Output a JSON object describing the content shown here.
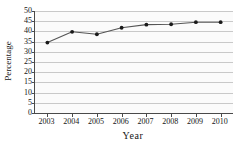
{
  "chart_data": {
    "type": "line",
    "title": "",
    "xlabel": "Year",
    "ylabel": "Percentage",
    "categories": [
      "2003",
      "2004",
      "2005",
      "2006",
      "2007",
      "2008",
      "2009",
      "2010"
    ],
    "x": [
      2003,
      2004,
      2005,
      2006,
      2007,
      2008,
      2009,
      2010
    ],
    "values": [
      34.5,
      39.8,
      38.6,
      41.8,
      43.3,
      43.5,
      44.5,
      44.5
    ],
    "series": [
      {
        "name": "Percentage",
        "values": [
          34.5,
          39.8,
          38.6,
          41.8,
          43.3,
          43.5,
          44.5,
          44.5
        ]
      }
    ],
    "ylim": [
      0,
      50
    ],
    "xlim": [
      2002.5,
      2010.5
    ],
    "yticks": [
      0,
      5,
      10,
      15,
      20,
      25,
      30,
      35,
      40,
      45,
      50
    ],
    "ytick_labels": [
      "0",
      "5",
      "10",
      "15",
      "20",
      "25",
      "30",
      "35",
      "40",
      "45",
      "50"
    ],
    "xticks": [
      2003,
      2004,
      2005,
      2006,
      2007,
      2008,
      2009,
      2010
    ],
    "xtick_labels": [
      "2003",
      "2004",
      "2005",
      "2006",
      "2007",
      "2008",
      "2009",
      "2010"
    ],
    "grid": "horizontal",
    "legend": "none",
    "line_color": "#555555",
    "marker_color": "#1a1a1a",
    "marker_shape": "circle",
    "plot_background": "#fbfbfb",
    "gridline_color": "#c9c9c9",
    "axis_color": "#4a4a4a"
  }
}
